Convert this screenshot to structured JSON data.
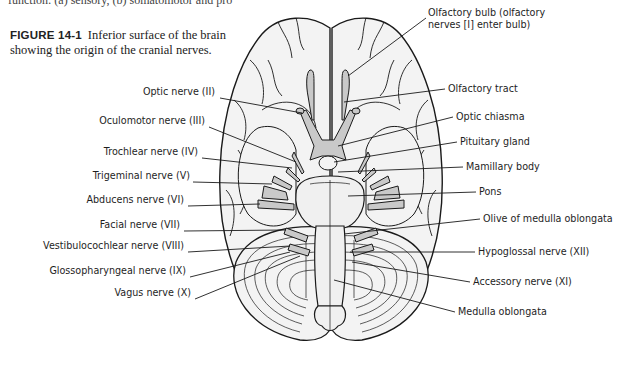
{
  "page": {
    "top_cut_text": "function: (a) sensory, (b) somatomotor and pro",
    "top_cut_right": ""
  },
  "figure": {
    "number": "FIGURE 14-1",
    "caption": "Inferior surface of the brain showing the origin of the cranial nerves."
  },
  "labels_left": [
    {
      "id": "optic-nerve",
      "text": "Optic nerve (II)",
      "x": 218,
      "y": 92
    },
    {
      "id": "oculomotor-nerve",
      "text": "Oculomotor nerve (III)",
      "x": 207,
      "y": 121
    },
    {
      "id": "trochlear-nerve",
      "text": "Trochlear nerve (IV)",
      "x": 200,
      "y": 152
    },
    {
      "id": "trigeminal-nerve",
      "text": "Trigeminal nerve (V)",
      "x": 191,
      "y": 176
    },
    {
      "id": "abducens-nerve",
      "text": "Abducens nerve (VI)",
      "x": 186,
      "y": 200
    },
    {
      "id": "facial-nerve",
      "text": "Facial nerve (VII)",
      "x": 182,
      "y": 225
    },
    {
      "id": "vestibulocochlear-nerve",
      "text": "Vestibulocochlear nerve (VIII)",
      "x": 186,
      "y": 246
    },
    {
      "id": "glossopharyngeal-nerve",
      "text": "Glossopharyngeal nerve (IX)",
      "x": 188,
      "y": 271
    },
    {
      "id": "vagus-nerve",
      "text": "Vagus nerve (X)",
      "x": 193,
      "y": 293
    }
  ],
  "labels_right": [
    {
      "id": "olfactory-bulb",
      "text": "Olfactory bulb (olfactory",
      "text2": "nerves [I] enter bulb)",
      "x": 428,
      "y": 12
    },
    {
      "id": "olfactory-tract",
      "text": "Olfactory tract",
      "x": 447,
      "y": 83
    },
    {
      "id": "optic-chiasma",
      "text": "Optic chiasma",
      "x": 455,
      "y": 111
    },
    {
      "id": "pituitary-gland",
      "text": "Pituitary gland",
      "x": 459,
      "y": 136
    },
    {
      "id": "mamillary-body",
      "text": "Mamillary body",
      "x": 465,
      "y": 161
    },
    {
      "id": "pons",
      "text": "Pons",
      "x": 478,
      "y": 186
    },
    {
      "id": "olive-medulla",
      "text": "Olive of medulla oblongata",
      "x": 482,
      "y": 213
    },
    {
      "id": "hypoglossal-nerve",
      "text": "Hypoglossal nerve (XII)",
      "x": 477,
      "y": 246
    },
    {
      "id": "accessory-nerve",
      "text": "Accessory nerve (XI)",
      "x": 472,
      "y": 276
    },
    {
      "id": "medulla-oblongata",
      "text": "Medulla oblongata",
      "x": 457,
      "y": 306
    }
  ],
  "colors": {
    "outline": "#1a1a1a",
    "brain_fill": "#f3f3f3",
    "nerve_fill": "#c9c9c9",
    "text": "#1e1e1e"
  }
}
